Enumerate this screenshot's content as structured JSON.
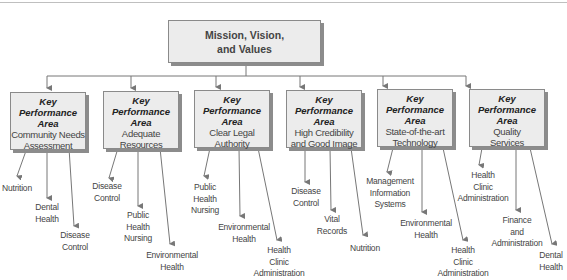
{
  "root": {
    "line1": "Mission, Vision,",
    "line2": "and Values"
  },
  "kpa_label_line1": "Key Performance",
  "kpa_label_line2": "Area",
  "areas": [
    {
      "title": "Community Needs Assessment",
      "line1": "Community Needs",
      "line2": "Assessment",
      "leaves": [
        "Nutrition",
        "Dental\nHealth",
        "Disease\nControl"
      ]
    },
    {
      "title": "Adequate Resources",
      "line1": "Adequate",
      "line2": "Resources",
      "leaves": [
        "Disease\nControl",
        "Public\nHealth\nNursing",
        "Environmental\nHealth"
      ]
    },
    {
      "title": "Clear Legal Authority",
      "line1": "Clear Legal",
      "line2": "Authority",
      "leaves": [
        "Public\nHealth\nNursing",
        "Environmental\nHealth",
        "Health\nClinic\nAdministration"
      ]
    },
    {
      "title": "High Credibility and Good Image",
      "line1": "High Credibility",
      "line2": "and Good Image",
      "leaves": [
        "Disease\nControl",
        "Vital\nRecords",
        "Nutrition"
      ]
    },
    {
      "title": "State-of-the-art Technology",
      "line1": "State-of-the-art",
      "line2": "Technology",
      "leaves": [
        "Management\nInformation\nSystems",
        "Environmental\nHealth",
        "Health\nClinic\nAdministration"
      ]
    },
    {
      "title": "Quality Services",
      "line1": "Quality",
      "line2": "Services",
      "leaves": [
        "Health\nClinic\nAdministration",
        "Finance\nand\nAdministration",
        "Dental\nHealth"
      ]
    }
  ]
}
